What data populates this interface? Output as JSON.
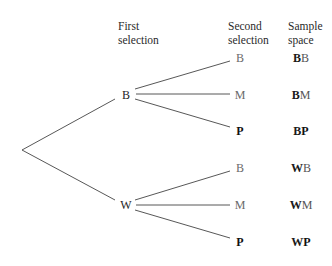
{
  "headers": {
    "first_selection": [
      "First",
      "selection"
    ],
    "second_selection": [
      "Second",
      "selection"
    ],
    "sample_space": [
      "Sample",
      "space"
    ]
  },
  "tree": {
    "first_level": [
      {
        "label": "B",
        "bold": false
      },
      {
        "label": "W",
        "bold": false
      }
    ],
    "second_level": [
      {
        "label": "B",
        "bold": false
      },
      {
        "label": "M",
        "bold": false
      },
      {
        "label": "P",
        "bold": true
      },
      {
        "label": "B",
        "bold": false
      },
      {
        "label": "M",
        "bold": false
      },
      {
        "label": "P",
        "bold": true
      }
    ]
  },
  "sample_space": [
    {
      "first": "B",
      "second": "B",
      "second_bold": false
    },
    {
      "first": "B",
      "second": "M",
      "second_bold": false
    },
    {
      "first": "B",
      "second": "P",
      "second_bold": true
    },
    {
      "first": "W",
      "second": "B",
      "second_bold": false
    },
    {
      "first": "W",
      "second": "M",
      "second_bold": false
    },
    {
      "first": "W",
      "second": "P",
      "second_bold": true
    }
  ]
}
